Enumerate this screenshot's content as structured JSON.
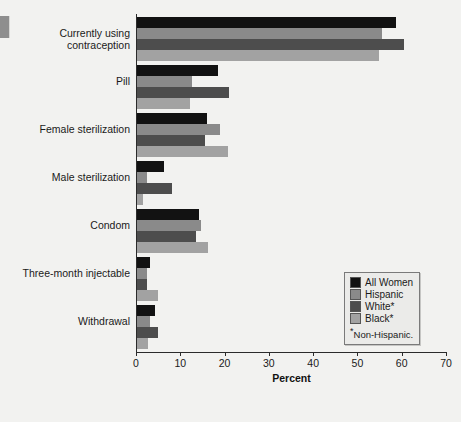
{
  "chart_data": {
    "type": "bar",
    "orientation": "horizontal",
    "title": "",
    "xlabel": "Percent",
    "ylabel": "",
    "xlim": [
      0,
      70
    ],
    "xticks": [
      0,
      10,
      20,
      30,
      40,
      50,
      60,
      70
    ],
    "grid": false,
    "legend_position": "inside-lower-right",
    "footnote": "Non-Hispanic.",
    "footnote_marker": "*",
    "categories": [
      "Currently using contraception",
      "Pill",
      "Female sterilization",
      "Male sterilization",
      "Condom",
      "Three-month injectable",
      "Withdrawal"
    ],
    "series": [
      {
        "name": "All Women",
        "color": "#121212",
        "values": [
          58.7,
          18.5,
          16.0,
          6.3,
          14.2,
          3.2,
          4.3
        ]
      },
      {
        "name": "Hispanic",
        "color": "#8a8a8a",
        "values": [
          55.5,
          12.6,
          19.0,
          2.5,
          14.7,
          2.4,
          3.1
        ]
      },
      {
        "name": "White*",
        "color": "#4d4d4d",
        "values": [
          60.5,
          21.0,
          15.6,
          8.1,
          13.5,
          2.4,
          5.0
        ]
      },
      {
        "name": "Black*",
        "color": "#a2a2a2",
        "values": [
          54.9,
          12.2,
          20.8,
          1.6,
          16.3,
          5.0,
          2.7
        ]
      }
    ]
  },
  "legend": {
    "items": [
      {
        "label": "All Women"
      },
      {
        "label": "Hispanic"
      },
      {
        "label": "White*"
      },
      {
        "label": "Black*"
      }
    ],
    "note_marker": "*",
    "note_text": "Non-Hispanic."
  },
  "axis": {
    "x_title": "Percent",
    "tick_labels": [
      "0",
      "10",
      "20",
      "30",
      "40",
      "50",
      "60",
      "70"
    ]
  }
}
